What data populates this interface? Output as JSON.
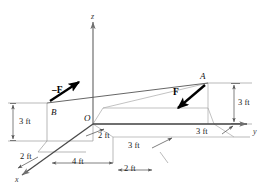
{
  "figure": {
    "type": "engineering-statics-3d-force-diagram",
    "axes": {
      "x_label": "x",
      "y_label": "y",
      "z_label": "z",
      "origin_label": "O"
    },
    "points": {
      "a_label": "A",
      "b_label": "B"
    },
    "forces": [
      {
        "id": "force-f",
        "label": "F",
        "applied_at": "A",
        "direction": "down-left-toward-B"
      },
      {
        "id": "force-minus-f",
        "label": "–F",
        "applied_at": "B",
        "direction": "up-right-toward-A"
      }
    ],
    "dimensions": [
      {
        "id": "dim-b-height",
        "value": "3 ft"
      },
      {
        "id": "dim-a-height",
        "value": "3 ft"
      },
      {
        "id": "dim-y-a-offset",
        "value": "3 ft"
      },
      {
        "id": "dim-x-a-offset",
        "value": "3 ft"
      },
      {
        "id": "dim-origin-y",
        "value": "2 ft"
      },
      {
        "id": "dim-x-left",
        "value": "2 ft"
      },
      {
        "id": "dim-x-mid",
        "value": "4 ft"
      },
      {
        "id": "dim-x-right",
        "value": "2 ft"
      }
    ],
    "colors": {
      "axis": "#6f6f6f",
      "axis_dark": "#4a4a4a",
      "construction": "#9a9a9a",
      "force": "#000000",
      "dimension": "#555555",
      "background": "#ffffff"
    }
  }
}
